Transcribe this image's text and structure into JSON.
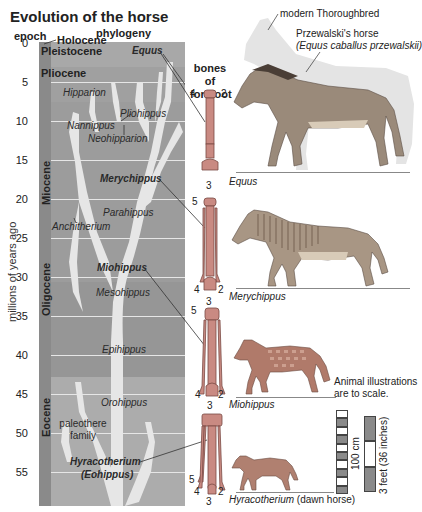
{
  "title": "Evolution of the horse",
  "headers": {
    "epoch": "epoch",
    "phylogeny": "phylogeny",
    "bones": "bones of forefoot"
  },
  "axis": {
    "label": "millions of years ago",
    "ticks": [
      "0",
      "5",
      "10",
      "15",
      "20",
      "25",
      "30",
      "35",
      "40",
      "45",
      "50",
      "55"
    ]
  },
  "epochs": [
    {
      "name": "Holocene",
      "start": 0
    },
    {
      "name": "Pleistocene",
      "start": 0.01
    },
    {
      "name": "Pliocene",
      "start": 2.6
    },
    {
      "name": "Miocene",
      "start": 5.3
    },
    {
      "name": "Oligocene",
      "start": 23
    },
    {
      "name": "Eocene",
      "start": 34
    }
  ],
  "genera": [
    {
      "name": "Equus",
      "bold": true
    },
    {
      "name": "Hipparion",
      "bold": false
    },
    {
      "name": "Pliohippus",
      "bold": false
    },
    {
      "name": "Nannippus",
      "bold": false
    },
    {
      "name": "Neohipparion",
      "bold": false
    },
    {
      "name": "Merychippus",
      "bold": true
    },
    {
      "name": "Parahippus",
      "bold": false
    },
    {
      "name": "Anchitherium",
      "bold": false
    },
    {
      "name": "Miohippus",
      "bold": true
    },
    {
      "name": "Mesohippus",
      "bold": false
    },
    {
      "name": "Epihippus",
      "bold": false
    },
    {
      "name": "Orohippus",
      "bold": false
    },
    {
      "name": "paleothere family",
      "bold": false
    },
    {
      "name": "Hyracotherium",
      "bold": true
    },
    {
      "name": "(Eohippus)",
      "bold": true
    }
  ],
  "labels": {
    "thoroughbred": "modern Thoroughbred",
    "przewalski_1": "Przewalski's horse",
    "przewalski_2": "(Equus caballus przewalskii)",
    "equus": "Equus",
    "merychippus": "Merychippus",
    "miohippus": "Miohippus",
    "hyracotherium": "Hyracotherium",
    "dawn_horse": " (dawn horse)",
    "scale_note_1": "Animal illustrations",
    "scale_note_2": "are to scale.",
    "scale_cm": "100 cm",
    "scale_ft": "3 feet (36 inches)"
  },
  "bones": [
    {
      "animal": "Equus",
      "digits": [
        "4",
        "2",
        "3"
      ]
    },
    {
      "animal": "Merychippus",
      "digits": [
        "5",
        "4",
        "2",
        "3"
      ]
    },
    {
      "animal": "Miohippus",
      "digits": [
        "5",
        "4",
        "2",
        "3"
      ]
    },
    {
      "animal": "Hyracotherium",
      "digits": [
        "5",
        "4",
        "2",
        "3"
      ]
    }
  ],
  "colors": {
    "chart_bg": "#b4b4b4",
    "epoch_col": "#8a8a8a",
    "tree": "#e8e8e8",
    "horse": "#8c7f72"
  }
}
